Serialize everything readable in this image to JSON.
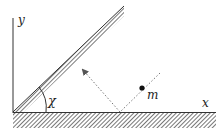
{
  "diagram": {
    "type": "physics-inclined-plane",
    "labels": {
      "y_axis": "y",
      "x_axis": "x",
      "angle": "χ",
      "mass": "m"
    },
    "colors": {
      "line": "#333333",
      "hatch": "#555555",
      "dotted": "#777777",
      "mass": "#111111"
    }
  }
}
